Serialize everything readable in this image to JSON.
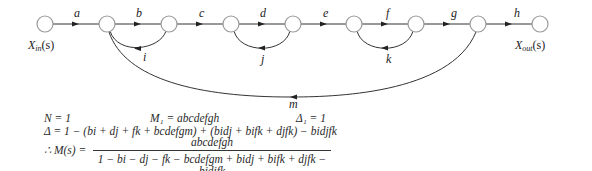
{
  "diagram": {
    "type": "signal-flow-graph",
    "nodes": [
      {
        "id": "n0",
        "x": 45,
        "label": "X_in(s)"
      },
      {
        "id": "n1",
        "x": 107
      },
      {
        "id": "n2",
        "x": 169
      },
      {
        "id": "n3",
        "x": 231
      },
      {
        "id": "n4",
        "x": 293
      },
      {
        "id": "n5",
        "x": 354
      },
      {
        "id": "n6",
        "x": 416
      },
      {
        "id": "n7",
        "x": 478
      },
      {
        "id": "n8",
        "x": 540,
        "label": "X_out(s)"
      }
    ],
    "forward_branches": [
      "a",
      "b",
      "c",
      "d",
      "e",
      "f",
      "g",
      "h"
    ],
    "feedback_branches": [
      {
        "label": "i",
        "from": "n2",
        "to": "n1"
      },
      {
        "label": "j",
        "from": "n4",
        "to": "n3"
      },
      {
        "label": "k",
        "from": "n6",
        "to": "n5"
      },
      {
        "label": "m",
        "from": "n7",
        "to": "n1"
      }
    ],
    "input_label": {
      "main": "X",
      "sub": "in",
      "arg": "(s)"
    },
    "output_label": {
      "main": "X",
      "sub": "out",
      "arg": "(s)"
    },
    "colors": {
      "node_stroke": "#999999",
      "edge": "#333333",
      "text": "#222222"
    }
  },
  "equations": {
    "line1": {
      "N": "N = 1",
      "M1": "M₁ = abcdefgh",
      "D1": "Δ₁ = 1"
    },
    "line2": "Δ = 1 − (bi + dj + fk + bcdefgm) + (bidj + bifk + djfk) − bidjfk",
    "line3": {
      "lhs": "∴ M(s) =",
      "numerator": "abcdefgh",
      "denominator": "1 − bi − dj − fk − bcdefgm + bidj + bifk + djfk − bidjfk"
    }
  }
}
